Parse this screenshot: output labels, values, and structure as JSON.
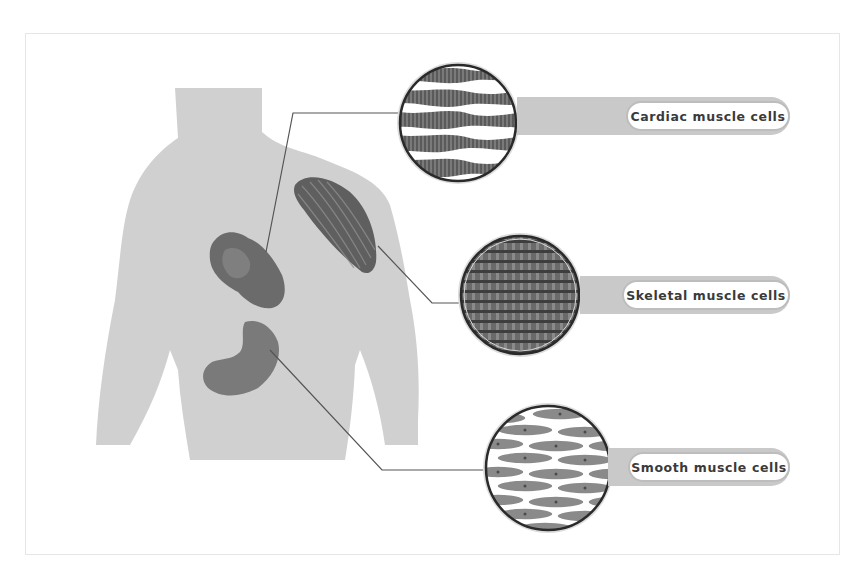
{
  "diagram": {
    "labels": [
      {
        "id": "cardiac",
        "text": "Cardiac muscle cells"
      },
      {
        "id": "skeletal",
        "text": "Skeletal muscle cells"
      },
      {
        "id": "smooth",
        "text": "Smooth muscle cells"
      }
    ],
    "organs": [
      "heart",
      "shoulder-muscle",
      "stomach"
    ],
    "colors": {
      "body": "#d0d0d0",
      "organ": "#6e6e6e",
      "band": "#c9c9c9",
      "pill_border": "#bdbdbd",
      "label_text": "#3a3a3a",
      "circle_border": "#2a2a2a",
      "connector": "#555555"
    }
  }
}
